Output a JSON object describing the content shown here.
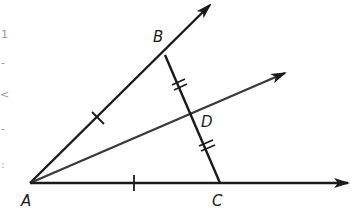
{
  "figure": {
    "type": "geometry",
    "colors": {
      "background": "#ffffff",
      "stroke": "#1a1a1a",
      "bisector": "#3a3a3a",
      "artifact": "#9a9a9a"
    },
    "points": {
      "A": {
        "label": "A",
        "x": 30,
        "y": 183
      },
      "B": {
        "label": "B",
        "x": 165,
        "y": 55
      },
      "C": {
        "label": "C",
        "x": 220,
        "y": 183
      },
      "D": {
        "label": "D",
        "x": 194,
        "y": 113
      }
    },
    "rays": [
      {
        "name": "ray-AB",
        "from": "A",
        "through": "B",
        "tip": [
          210,
          5
        ]
      },
      {
        "name": "ray-AD",
        "from": "A",
        "through": "D",
        "tip": [
          285,
          73
        ]
      },
      {
        "name": "ray-AC",
        "from": "A",
        "through": "C",
        "tip": [
          348,
          183
        ]
      }
    ],
    "segments": [
      {
        "name": "segment-BC",
        "from": "B",
        "to": "C"
      }
    ],
    "congruence_marks": [
      {
        "segment": "AB",
        "ticks": 1
      },
      {
        "segment": "AC",
        "ticks": 1
      },
      {
        "segment": "BD",
        "ticks": 2
      },
      {
        "segment": "DC",
        "ticks": 2
      }
    ],
    "labels": {
      "A": "A",
      "B": "B",
      "C": "C",
      "D": "D"
    },
    "edge_artifacts": [
      "1",
      "-",
      "<",
      "-",
      ":"
    ]
  }
}
